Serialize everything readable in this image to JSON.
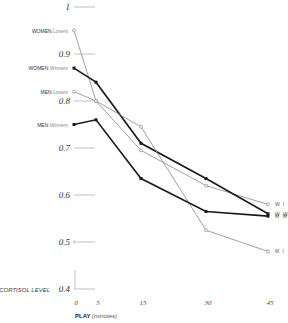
{
  "chart_data": {
    "type": "line",
    "title": "",
    "xlabel": "PLAY (minutes)",
    "xlabel_bold": "PLAY",
    "xlabel_unit": "(minutes)",
    "ylabel": "CORTISOL LEVEL",
    "x": [
      0,
      5,
      15,
      30,
      45
    ],
    "x_ticks": [
      "0",
      "5",
      "15",
      "30",
      "45"
    ],
    "y_ticks": [
      "1",
      "0.9",
      "0.8",
      "0.7",
      "0.6",
      "0.5",
      "0.4"
    ],
    "ylim": [
      0.4,
      1.0
    ],
    "grid": false,
    "series": [
      {
        "name": "WOMEN Losers",
        "start_label_bold": "WOMEN",
        "start_label_light": "Losers",
        "end_label": "W l",
        "style": "thin-gray-open",
        "values": [
          0.95,
          0.8,
          0.695,
          0.62,
          0.58
        ]
      },
      {
        "name": "WOMEN Winners",
        "start_label_bold": "WOMEN",
        "start_label_light": "Winners",
        "end_label": "W W",
        "style": "thick-black-filled",
        "values": [
          0.87,
          0.84,
          0.71,
          0.635,
          0.56
        ]
      },
      {
        "name": "MEN Losers",
        "start_label_bold": "MEN",
        "start_label_light": "Losers",
        "end_label": "M l",
        "style": "thin-gray-open",
        "values": [
          0.82,
          0.8,
          0.745,
          0.525,
          0.48
        ]
      },
      {
        "name": "MEN Winners",
        "start_label_bold": "MEN",
        "start_label_light": "Winners",
        "end_label": "M W",
        "style": "thick-black-filled",
        "values": [
          0.75,
          0.76,
          0.635,
          0.565,
          0.555
        ]
      }
    ]
  }
}
